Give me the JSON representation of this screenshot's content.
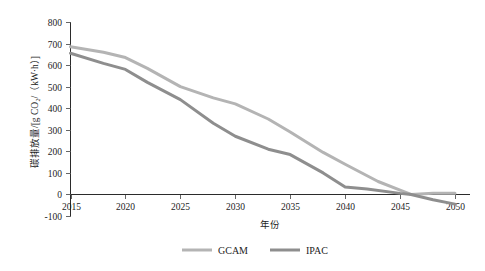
{
  "chart_data": {
    "type": "line",
    "title": "",
    "xlabel": "年份",
    "ylabel": "碳排放量/[g CO₂/（kW·h）]",
    "xlim": [
      2015,
      2050
    ],
    "ylim": [
      -100,
      800
    ],
    "grid": false,
    "legend_position": "bottom-center",
    "x": [
      2015,
      2020,
      2025,
      2030,
      2035,
      2040,
      2045,
      2050
    ],
    "xticks": [
      "2015",
      "2020",
      "2025",
      "2030",
      "2035",
      "2040",
      "2045",
      "2050"
    ],
    "yticks": [
      "800",
      "700",
      "600",
      "500",
      "400",
      "300",
      "200",
      "100",
      "0",
      "-100"
    ],
    "ytick_values": [
      800,
      700,
      600,
      500,
      400,
      300,
      200,
      100,
      0,
      -100
    ],
    "series": [
      {
        "name": "GCAM",
        "color": "#b4b4b4",
        "x": [
          2015,
          2018,
          2020,
          2022,
          2025,
          2028,
          2030,
          2033,
          2035,
          2038,
          2040,
          2043,
          2045,
          2046,
          2048,
          2050
        ],
        "values": [
          685,
          660,
          635,
          585,
          500,
          448,
          420,
          350,
          290,
          195,
          140,
          60,
          20,
          0,
          5,
          5
        ]
      },
      {
        "name": "IPAC",
        "color": "#8e8e8e",
        "x": [
          2015,
          2018,
          2020,
          2022,
          2025,
          2028,
          2030,
          2033,
          2035,
          2038,
          2040,
          2042,
          2045,
          2046,
          2048,
          2050
        ],
        "values": [
          655,
          608,
          580,
          520,
          440,
          330,
          270,
          210,
          185,
          100,
          35,
          25,
          5,
          0,
          -25,
          -45
        ]
      }
    ],
    "legend": [
      {
        "label": "GCAM",
        "color": "#b4b4b4"
      },
      {
        "label": "IPAC",
        "color": "#8e8e8e"
      }
    ]
  }
}
